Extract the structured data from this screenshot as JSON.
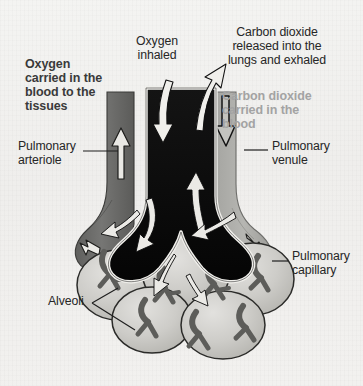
{
  "figure": {
    "background_color": "#f1f0ee",
    "colors": {
      "bronchiole": "#0a0a0a",
      "arteriole": "#6f6f6f",
      "venule": "#a9a9a9",
      "alveoli": "#c9c9c7",
      "capillary": "#6a6a68",
      "text_dark": "#2a2a2a",
      "text_light": "#a3a3a3",
      "arrow_light": "#f0efed"
    }
  },
  "labels": {
    "oxygen_carried": {
      "text": "Oxygen\ncarried in the\nblood to the\ntissues",
      "style": "bold-dark"
    },
    "oxygen_inhaled": {
      "text": "Oxygen\ninhaled",
      "style": "plain"
    },
    "carbon_dioxide_released": {
      "text": "Carbon dioxide\nreleased into the\nlungs and exhaled",
      "style": "plain"
    },
    "carbon_dioxide_carried": {
      "text": "Carbon dioxide\ncarried in the\nblood",
      "style": "bold-light"
    },
    "pulmonary_arteriole": {
      "text": "Pulmonary\narteriole",
      "style": "plain"
    },
    "pulmonary_venule": {
      "text": "Pulmonary\nvenule",
      "style": "plain"
    },
    "pulmonary_capillary": {
      "text": "Pulmonary\ncapillary",
      "style": "plain"
    },
    "alveoli": {
      "text": "Alveoli",
      "style": "plain"
    }
  },
  "structures": [
    {
      "name": "bronchiole",
      "description": "central black airway branching into two lobes"
    },
    {
      "name": "pulmonary-arteriole",
      "description": "dark gray vessel on the left carrying blood up"
    },
    {
      "name": "pulmonary-venule",
      "description": "light gray vessel on the right carrying blood down"
    },
    {
      "name": "alveoli-cluster",
      "description": "cluster of light gray air sacs below the bronchiole"
    },
    {
      "name": "pulmonary-capillaries",
      "description": "dark branching vessels over the alveoli"
    }
  ],
  "flow_arrows": [
    {
      "name": "oxygen-inhaled-arrow",
      "direction": "down",
      "color": "light"
    },
    {
      "name": "carbon-dioxide-exhaled-arrow",
      "direction": "up-right",
      "color": "light"
    },
    {
      "name": "arteriole-blood-arrow",
      "direction": "up",
      "color": "light"
    },
    {
      "name": "venule-blood-arrow",
      "direction": "down",
      "color": "dark"
    },
    {
      "name": "bronchiole-left-branch-arrow",
      "direction": "down-left",
      "color": "light"
    },
    {
      "name": "bronchiole-right-branch-arrow",
      "direction": "down-left",
      "color": "light"
    },
    {
      "name": "alveolar-left-arrow",
      "direction": "left",
      "color": "light"
    },
    {
      "name": "alveolar-right-arrow",
      "direction": "left",
      "color": "light"
    },
    {
      "name": "bronchiole-center-up-arrow",
      "direction": "up",
      "color": "light"
    }
  ]
}
